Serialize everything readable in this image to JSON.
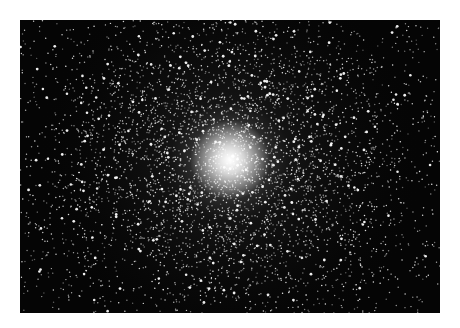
{
  "image": {
    "subject": "globular star cluster",
    "background_color": "#ffffff",
    "frame": {
      "x": 20,
      "y": 20,
      "width": 420,
      "height": 293,
      "color": "#050505"
    },
    "core": {
      "cx": 210,
      "cy": 140,
      "color": "#ffffff"
    },
    "star_field": {
      "seed": 47,
      "background_stars": 900,
      "cluster_stars": 4200,
      "cluster_sigma_x": 95,
      "cluster_sigma_y": 80,
      "star_color": "#ffffff"
    }
  }
}
